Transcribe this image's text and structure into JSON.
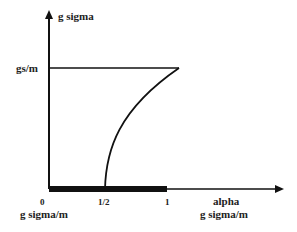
{
  "diagram": {
    "y_axis_label": "g sigma",
    "y_tick_label": "gs/m",
    "x_axis_label_line1": "alpha",
    "x_axis_label_line2": "g sigma/m",
    "x_origin_label": "0",
    "x_origin_sublabel": "g sigma/m",
    "x_ticks": [
      "1/2",
      "1"
    ],
    "colors": {
      "line": "#111111",
      "text": "#222222"
    }
  }
}
